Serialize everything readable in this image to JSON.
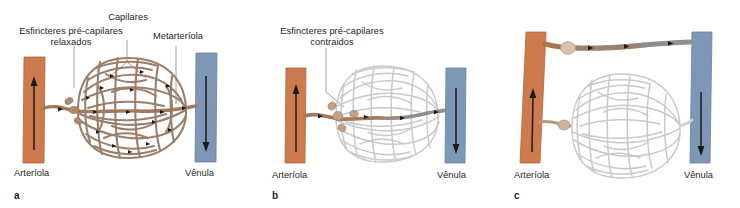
{
  "figure": {
    "panel_count": 3
  },
  "colors": {
    "arteriole": "#cd7b4d",
    "arteriole_edge": "#b0663c",
    "venule": "#7d98b6",
    "venule_edge": "#67839f",
    "capillary_perfused": "#9a7f6b",
    "capillary_perfused_dark": "#7d6350",
    "capillary_unperfused": "#c9c9c9",
    "metarteriole": "#a07a5e",
    "shunt_venous": "#8b8f96",
    "text": "#231f20",
    "leader_line": "#6e6e6e",
    "arrow": "#1a1a1a"
  },
  "panels": [
    {
      "id": "a",
      "letter": "a",
      "state": "relaxed",
      "labels": {
        "sphincters": "Esfincteres pré-capilares\nrelaxados",
        "capillaries": "Capilares",
        "metarteriole": "Metarteríola",
        "arteriole": "Arteríola",
        "venule": "Vênula"
      },
      "description": "Esfíncteres pré-capilares relaxados: todo o leito capilar está perfundido"
    },
    {
      "id": "b",
      "letter": "b",
      "state": "contracted",
      "labels": {
        "sphincters": "Esfincteres pré-capilares\ncontraidos",
        "arteriole": "Arteríola",
        "venule": "Vênula"
      },
      "description": "Esfíncteres pré-capilares contraídos: o sangue passa somente pelo canal preferencial"
    },
    {
      "id": "c",
      "letter": "c",
      "state": "shunt",
      "labels": {
        "arteriole": "Arteríola",
        "venule": "Vênula"
      },
      "description": "Anastomose arteriovenosa aberta: o sangue desvia do leito capilar"
    }
  ]
}
